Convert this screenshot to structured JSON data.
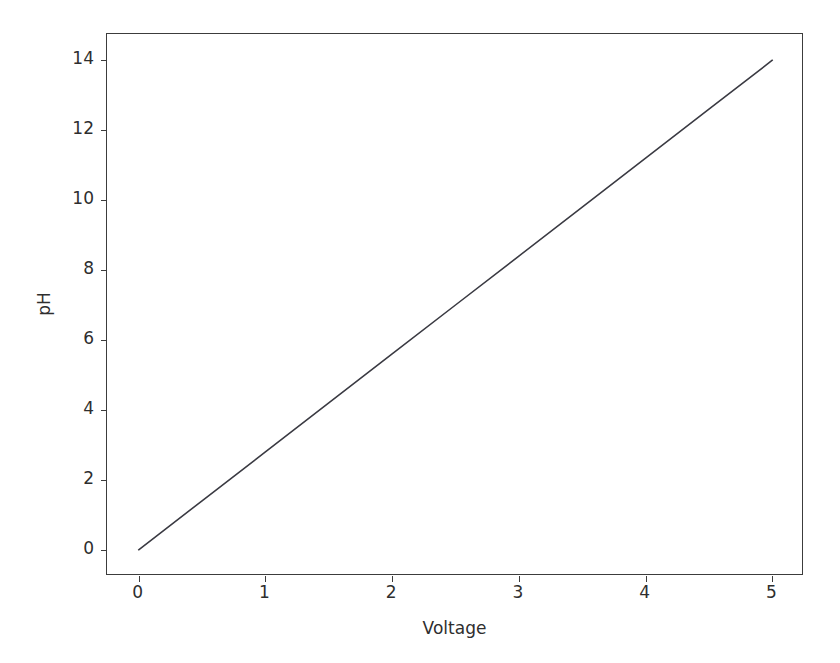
{
  "figure": {
    "background_color": "#ffffff",
    "axes_edge_color": "#3c3c3c",
    "tick_label_color": "#2e2e2e"
  },
  "chart_data": {
    "type": "line",
    "title": "",
    "subtitle": "",
    "xlabel": "Voltage",
    "ylabel": "pH",
    "xlim": [
      -0.25,
      5.25
    ],
    "ylim": [
      -0.75,
      14.75
    ],
    "xticks": [
      0,
      1,
      2,
      3,
      4,
      5
    ],
    "xtick_labels": [
      "0",
      "1",
      "2",
      "3",
      "4",
      "5"
    ],
    "yticks": [
      0,
      2,
      4,
      6,
      8,
      10,
      12,
      14
    ],
    "ytick_labels": [
      "0",
      "2",
      "4",
      "6",
      "8",
      "10",
      "12",
      "14"
    ],
    "grid": false,
    "legend": null,
    "legend_position": "none",
    "annotations": [],
    "series": [
      {
        "name": "pH vs Voltage",
        "color": "#3a3a42",
        "line_width": 1.5,
        "marker": "none",
        "x": [
          0,
          0.5,
          1,
          1.5,
          2,
          2.5,
          3,
          3.5,
          4,
          4.5,
          5
        ],
        "values": [
          0,
          1.4,
          2.8,
          4.2,
          5.6,
          7.0,
          8.4,
          9.8,
          11.2,
          12.6,
          14.0
        ]
      }
    ]
  }
}
